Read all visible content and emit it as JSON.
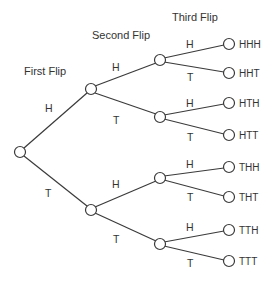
{
  "diagram": {
    "headers": {
      "first_flip": "First Flip",
      "second_flip": "Second Flip",
      "third_flip": "Third Flip"
    },
    "colors": {
      "line": "#3a3a3a",
      "text": "#333333",
      "background": "#ffffff"
    },
    "level1": [
      {
        "edge_label": "H"
      },
      {
        "edge_label": "T"
      }
    ],
    "level2": [
      {
        "edge_label": "H"
      },
      {
        "edge_label": "T"
      },
      {
        "edge_label": "H"
      },
      {
        "edge_label": "T"
      }
    ],
    "level3": [
      {
        "edge_label": "H",
        "outcome": "HHH"
      },
      {
        "edge_label": "T",
        "outcome": "HHT"
      },
      {
        "edge_label": "H",
        "outcome": "HTH"
      },
      {
        "edge_label": "T",
        "outcome": "HTT"
      },
      {
        "edge_label": "H",
        "outcome": "THH"
      },
      {
        "edge_label": "T",
        "outcome": "THT"
      },
      {
        "edge_label": "H",
        "outcome": "TTH"
      },
      {
        "edge_label": "T",
        "outcome": "TTT"
      }
    ]
  }
}
